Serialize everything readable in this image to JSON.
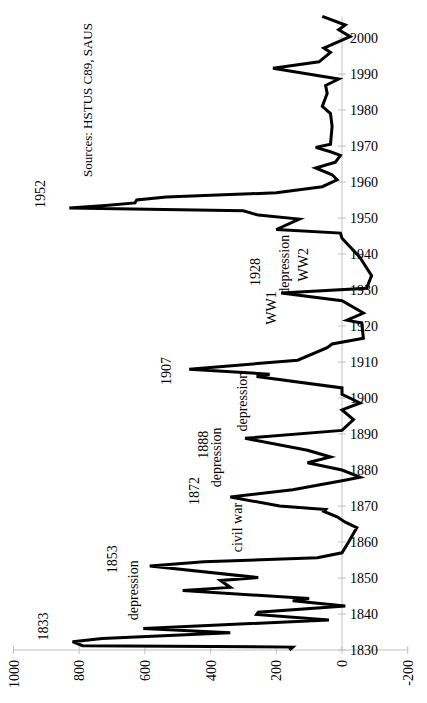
{
  "chart_data": {
    "type": "line",
    "orientation": "rotated-90-ccw",
    "title": "",
    "xlabel": "",
    "ylabel": "",
    "source": "Sources: HSTUS C89, SAUS",
    "xlim": [
      1830,
      2006
    ],
    "ylim": [
      -200,
      1000
    ],
    "x_ticks": [
      "1830",
      "1840",
      "1850",
      "1860",
      "1870",
      "1880",
      "1890",
      "1900",
      "1910",
      "1920",
      "1930",
      "1940",
      "1950",
      "1960",
      "1970",
      "1980",
      "1990",
      "2000"
    ],
    "y_ticks": [
      "1000",
      "800",
      "600",
      "400",
      "200",
      "0",
      "-200"
    ],
    "grid": false,
    "legend": false,
    "series": [
      {
        "name": "value",
        "color": "#000000",
        "points": [
          [
            1830.0,
            160
          ],
          [
            1830.8,
            150
          ],
          [
            1831.2,
            790
          ],
          [
            1832.3,
            820
          ],
          [
            1833.2,
            730
          ],
          [
            1834.8,
            340
          ],
          [
            1836.0,
            605
          ],
          [
            1838.3,
            40
          ],
          [
            1839.9,
            260
          ],
          [
            1840.5,
            255
          ],
          [
            1842.2,
            -10
          ],
          [
            1843.7,
            150
          ],
          [
            1844.3,
            100
          ],
          [
            1846.5,
            485
          ],
          [
            1847.4,
            340
          ],
          [
            1849.3,
            370
          ],
          [
            1850.1,
            255
          ],
          [
            1853.3,
            585
          ],
          [
            1854.5,
            420
          ],
          [
            1855.6,
            75
          ],
          [
            1857.0,
            0
          ],
          [
            1860.0,
            -20
          ],
          [
            1864.0,
            -45
          ],
          [
            1865.5,
            -10
          ],
          [
            1867.0,
            15
          ],
          [
            1868.5,
            55
          ],
          [
            1869.0,
            50
          ],
          [
            1870.0,
            190
          ],
          [
            1872.5,
            340
          ],
          [
            1874.5,
            150
          ],
          [
            1877.0,
            0
          ],
          [
            1878.0,
            -55
          ],
          [
            1880.0,
            0
          ],
          [
            1882.0,
            105
          ],
          [
            1883.6,
            35
          ],
          [
            1885.5,
            105
          ],
          [
            1888.8,
            295
          ],
          [
            1891.0,
            0
          ],
          [
            1894.0,
            -35
          ],
          [
            1896.7,
            0
          ],
          [
            1898.6,
            -55
          ],
          [
            1901.0,
            0
          ],
          [
            1902.8,
            0
          ],
          [
            1906.0,
            260
          ],
          [
            1906.6,
            220
          ],
          [
            1908.0,
            465
          ],
          [
            1910.5,
            135
          ],
          [
            1914.0,
            45
          ],
          [
            1915.0,
            30
          ],
          [
            1916.6,
            -65
          ],
          [
            1920.8,
            -60
          ],
          [
            1921.6,
            -15
          ],
          [
            1923.6,
            -65
          ],
          [
            1927.0,
            0
          ],
          [
            1929.2,
            185
          ],
          [
            1930.5,
            -75
          ],
          [
            1934.0,
            -90
          ],
          [
            1939.0,
            -55
          ],
          [
            1944.4,
            0
          ],
          [
            1945.8,
            5
          ],
          [
            1946.8,
            200
          ],
          [
            1949.7,
            130
          ],
          [
            1950.8,
            255
          ],
          [
            1952.0,
            300
          ],
          [
            1952.8,
            830
          ],
          [
            1953.5,
            720
          ],
          [
            1954.2,
            630
          ],
          [
            1955.0,
            625
          ],
          [
            1955.8,
            535
          ],
          [
            1957.0,
            200
          ],
          [
            1958.7,
            60
          ],
          [
            1960.6,
            15
          ],
          [
            1962.0,
            30
          ],
          [
            1963.9,
            80
          ],
          [
            1965.5,
            20
          ],
          [
            1967.4,
            5
          ],
          [
            1968.4,
            35
          ],
          [
            1969.6,
            80
          ],
          [
            1970.5,
            35
          ],
          [
            1975.5,
            30
          ],
          [
            1979.0,
            35
          ],
          [
            1981.0,
            60
          ],
          [
            1984.6,
            45
          ],
          [
            1986.8,
            50
          ],
          [
            1988.6,
            10
          ],
          [
            1991.6,
            210
          ],
          [
            1993.4,
            70
          ],
          [
            1996.0,
            35
          ],
          [
            1997.2,
            55
          ],
          [
            2000.4,
            -25
          ],
          [
            2002.3,
            10
          ],
          [
            2003.6,
            -10
          ],
          [
            2006.0,
            60
          ]
        ]
      }
    ],
    "annotations": [
      {
        "text": "1833",
        "year": 1836.5,
        "value": 895
      },
      {
        "text": "depression",
        "year": 1846.6,
        "value": 620
      },
      {
        "text": "1853",
        "year": 1855.2,
        "value": 685
      },
      {
        "text": "civil war",
        "year": 1864.0,
        "value": 305
      },
      {
        "text": "1872",
        "year": 1874.2,
        "value": 435
      },
      {
        "text": "depression",
        "year": 1883.5,
        "value": 370
      },
      {
        "text": "1888",
        "year": 1887.0,
        "value": 408
      },
      {
        "text": "depression",
        "year": 1899.0,
        "value": 290
      },
      {
        "text": "1907",
        "year": 1907.5,
        "value": 520
      },
      {
        "text": "WW1",
        "year": 1925.0,
        "value": 200
      },
      {
        "text": "1928",
        "year": 1935.0,
        "value": 250
      },
      {
        "text": "depression",
        "year": 1937.0,
        "value": 160
      },
      {
        "text": "WW2",
        "year": 1937.0,
        "value": 105
      },
      {
        "text": "1952",
        "year": 1956.7,
        "value": 904
      }
    ]
  },
  "source_label": "Sources: HSTUS C89, SAUS"
}
